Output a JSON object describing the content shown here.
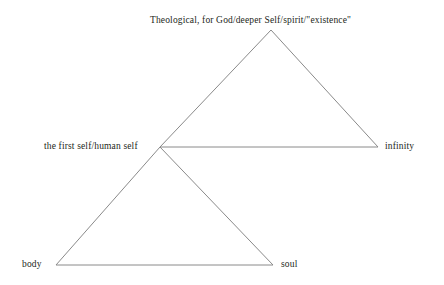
{
  "diagram": {
    "title_text": "Theological, for God/deeper Self/spirit/\"existence\"",
    "background_color": "#ffffff",
    "line_color": "#8a8a8a",
    "text_color": "#231f20",
    "nodes": [
      {
        "id": "theological",
        "label": "Theological, for God/deeper Self/spirit/\"existence\"",
        "x": 271,
        "y": 30
      },
      {
        "id": "first-self",
        "label": "the first self/human self",
        "x": 160,
        "y": 147
      },
      {
        "id": "infinity",
        "label": "infinity",
        "x": 378,
        "y": 147
      },
      {
        "id": "body",
        "label": "body",
        "x": 56,
        "y": 265
      },
      {
        "id": "soul",
        "label": "soul",
        "x": 273,
        "y": 265
      }
    ],
    "edges": [
      {
        "id": "upper-left-edge",
        "from": "first-self",
        "to": "theological"
      },
      {
        "id": "upper-right-edge",
        "from": "theological",
        "to": "infinity"
      },
      {
        "id": "upper-base-edge",
        "from": "first-self",
        "to": "infinity"
      },
      {
        "id": "lower-left-edge",
        "from": "first-self",
        "to": "body"
      },
      {
        "id": "lower-right-edge",
        "from": "first-self",
        "to": "soul"
      },
      {
        "id": "lower-base-edge",
        "from": "body",
        "to": "soul"
      }
    ]
  }
}
